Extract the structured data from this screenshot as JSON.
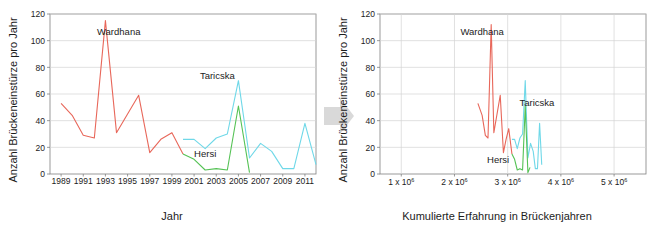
{
  "figure": {
    "arrow_icon": "right-arrow-icon",
    "arrow_color": "#d9d9d9",
    "background": "#ffffff",
    "panels": [
      "left",
      "right"
    ]
  },
  "colors": {
    "wardhana": "#e8675a",
    "taricska": "#6fd8e8",
    "hersi": "#55c255",
    "grid": "#d4d4d4",
    "axis": "#808080",
    "text": "#1c1c1c"
  },
  "left_panel": {
    "ylabel": "Anzahl Brückeneinstürze pro Jahr",
    "xlabel": "Jahr",
    "yticks": [
      "0",
      "20",
      "40",
      "60",
      "80",
      "100",
      "120"
    ],
    "xticks": [
      "1989",
      "1991",
      "1993",
      "1995",
      "1997",
      "1999",
      "2001",
      "2003",
      "2005",
      "2007",
      "2009",
      "2011"
    ],
    "annotations": [
      {
        "text": "Wardhana",
        "x": 1994.2,
        "y": 104
      },
      {
        "text": "Taricska",
        "x": 2003.1,
        "y": 71
      },
      {
        "text": "Hersi",
        "x": 2002.0,
        "y": 13
      }
    ]
  },
  "right_panel": {
    "ylabel": "Anzahl Brückeneinstürze pro Jahr",
    "xlabel": "Kumulierte Erfahrung in Brückenjahren",
    "yticks": [
      "0",
      "20",
      "40",
      "60",
      "80",
      "100",
      "120"
    ],
    "xticks": [
      {
        "mantissa": "1 x 10",
        "exponent": "6",
        "value": 1
      },
      {
        "mantissa": "2 x 10",
        "exponent": "6",
        "value": 2
      },
      {
        "mantissa": "3 x 10",
        "exponent": "6",
        "value": 3
      },
      {
        "mantissa": "4 x 10",
        "exponent": "6",
        "value": 4
      },
      {
        "mantissa": "5 x 10",
        "exponent": "6",
        "value": 5
      }
    ],
    "annotations": [
      {
        "text": "Wardhana",
        "x": 2.52,
        "y": 104
      },
      {
        "text": "Taricska",
        "x": 3.55,
        "y": 51
      },
      {
        "text": "Hersi",
        "x": 2.82,
        "y": 8
      }
    ]
  },
  "chart_data": [
    {
      "id": "left",
      "type": "line",
      "title": "",
      "xlabel": "Jahr",
      "ylabel": "Anzahl Brückeneinstürze pro Jahr",
      "xlim": [
        1988,
        2012
      ],
      "ylim": [
        0,
        120
      ],
      "grid": true,
      "legend": "inline-annotations",
      "series": [
        {
          "name": "Wardhana",
          "color": "#e8675a",
          "x": [
            1989,
            1990,
            1991,
            1992,
            1993,
            1994,
            1995,
            1996,
            1997,
            1998,
            1999,
            2000
          ],
          "values": [
            53,
            44,
            29,
            27,
            115,
            31,
            45,
            59,
            16,
            26,
            31,
            15
          ]
        },
        {
          "name": "Taricska",
          "color": "#6fd8e8",
          "x": [
            2000,
            2001,
            2002,
            2003,
            2004,
            2005,
            2006,
            2007,
            2008,
            2009,
            2010,
            2011,
            2012
          ],
          "values": [
            26,
            26,
            19,
            27,
            30,
            70,
            12,
            23,
            17,
            4,
            4,
            38,
            7
          ]
        },
        {
          "name": "Hersi",
          "color": "#55c255",
          "x": [
            2000,
            2001,
            2002,
            2003,
            2004,
            2005,
            2006
          ],
          "values": [
            15,
            11,
            3,
            4,
            3,
            51,
            1,
            5
          ]
        }
      ]
    },
    {
      "id": "right",
      "type": "line",
      "title": "",
      "xlabel": "Kumulierte Erfahrung in Brückenjahren",
      "ylabel": "Anzahl Brückeneinstürze pro Jahr",
      "xlim": [
        0.6,
        5.6
      ],
      "xunit": "x 10^6",
      "ylim": [
        0,
        120
      ],
      "grid": true,
      "legend": "inline-annotations",
      "series": [
        {
          "name": "Wardhana",
          "color": "#e8675a",
          "x": [
            2.44,
            2.52,
            2.58,
            2.63,
            2.69,
            2.74,
            2.8,
            2.86,
            2.92,
            2.97,
            3.02,
            3.08
          ],
          "values": [
            53,
            44,
            29,
            27,
            112,
            31,
            45,
            59,
            16,
            26,
            34,
            15
          ]
        },
        {
          "name": "Taricska",
          "color": "#6fd8e8",
          "x": [
            3.08,
            3.13,
            3.18,
            3.23,
            3.28,
            3.33,
            3.38,
            3.43,
            3.48,
            3.52,
            3.56,
            3.6,
            3.64
          ],
          "values": [
            26,
            26,
            19,
            27,
            30,
            70,
            12,
            23,
            17,
            4,
            4,
            38,
            7
          ]
        },
        {
          "name": "Hersi",
          "color": "#55c255",
          "x": [
            3.08,
            3.13,
            3.18,
            3.23,
            3.28,
            3.33,
            3.38,
            3.42
          ],
          "values": [
            15,
            11,
            3,
            4,
            3,
            51,
            1,
            5
          ]
        }
      ]
    }
  ]
}
